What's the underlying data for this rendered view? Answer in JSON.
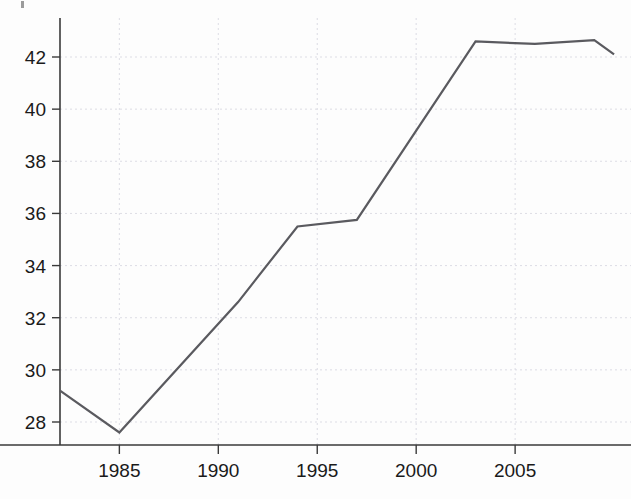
{
  "chart_data": {
    "type": "line",
    "title": "",
    "subtitle": "",
    "xlabel": "",
    "ylabel": "",
    "xlim": [
      1982,
      2010.3
    ],
    "ylim": [
      27.1,
      43.1
    ],
    "grid": true,
    "legend_position": "none",
    "x_tick_labels": [
      "1985",
      "1990",
      "1995",
      "2000",
      "2005"
    ],
    "x_ticks": [
      1985,
      1990,
      1995,
      2000,
      2005
    ],
    "y_tick_labels": [
      "28",
      "30",
      "32",
      "34",
      "36",
      "38",
      "40",
      "42"
    ],
    "y_ticks": [
      28,
      30,
      32,
      34,
      36,
      38,
      40,
      42
    ],
    "series": [
      {
        "name": "series-1",
        "color": "#5a5a5f",
        "x": [
          1982,
          1985,
          1991,
          1994,
          1997,
          2003,
          2006,
          2009,
          2010
        ],
        "values": [
          29.2,
          27.6,
          32.6,
          35.5,
          35.75,
          42.6,
          42.5,
          42.65,
          42.1
        ]
      }
    ]
  },
  "colors": {
    "line": "#5a5a5f",
    "axis": "#3a3a3a",
    "grid": "#d9d9e2",
    "text": "#1a1a1a",
    "background": "#fdfdfd"
  }
}
